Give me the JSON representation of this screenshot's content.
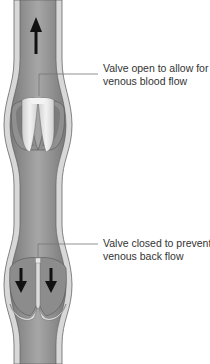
{
  "diagram": {
    "labels": [
      {
        "id": "open-valve",
        "lines": [
          "Valve open to allow for",
          "venous blood flow"
        ]
      },
      {
        "id": "closed-valve",
        "lines": [
          "Valve closed to prevent",
          "venous back flow"
        ]
      }
    ],
    "arrows": [
      {
        "id": "upward-flow",
        "direction": "up",
        "meaning": "blood flow toward heart"
      },
      {
        "id": "backflow-left",
        "direction": "down"
      },
      {
        "id": "backflow-right",
        "direction": "down"
      }
    ],
    "colors": {
      "vessel_wall": "#d8d8d8",
      "wall_outline": "#666666",
      "lumen": "#8a8a8a",
      "lumen_highlight": "#a8a8a8",
      "valve_open": "#e6e6e6",
      "arrow": "#111111",
      "leader_line": "#777777",
      "label_text": "#333333"
    }
  }
}
